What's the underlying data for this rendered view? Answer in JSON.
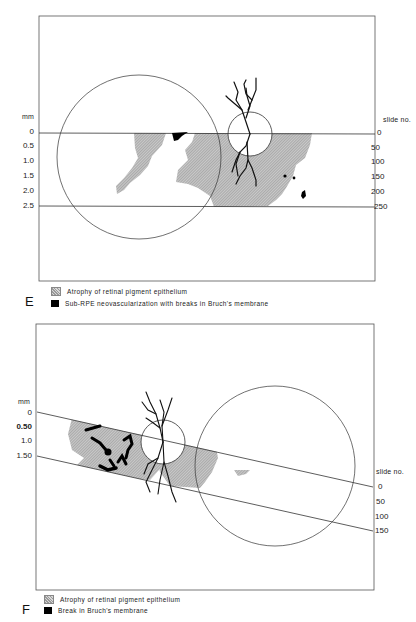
{
  "panels": [
    {
      "id": "E",
      "label": "E",
      "left_axis": {
        "title": "mm",
        "ticks": [
          "0",
          "0.5",
          "1.0",
          "1.5",
          "2.0",
          "2.5"
        ]
      },
      "right_axis": {
        "title": "slide no.",
        "ticks": [
          "0",
          "50",
          "100",
          "150",
          "200",
          "250"
        ]
      },
      "legend": [
        {
          "swatch": "hatched-gray",
          "text": "Atrophy of retinal pigment epithelium"
        },
        {
          "swatch": "solid-black",
          "text": "Sub-RPE neovascularization with breaks in Bruch's membrane"
        }
      ]
    },
    {
      "id": "F",
      "label": "F",
      "left_axis": {
        "title": "mm",
        "ticks": [
          "0",
          "0.50",
          "1.0",
          "1.50"
        ]
      },
      "right_axis": {
        "title": "slide no.",
        "ticks": [
          "0",
          "50",
          "100",
          "150"
        ]
      },
      "legend": [
        {
          "swatch": "hatched-gray",
          "text": "Atrophy of retinal pigment epithelium"
        },
        {
          "swatch": "solid-black",
          "text": "Break in Bruch's membrane"
        }
      ]
    }
  ],
  "colors": {
    "atrophy": "#a8a8a8",
    "neovascularization": "#000000",
    "line": "#333333"
  }
}
